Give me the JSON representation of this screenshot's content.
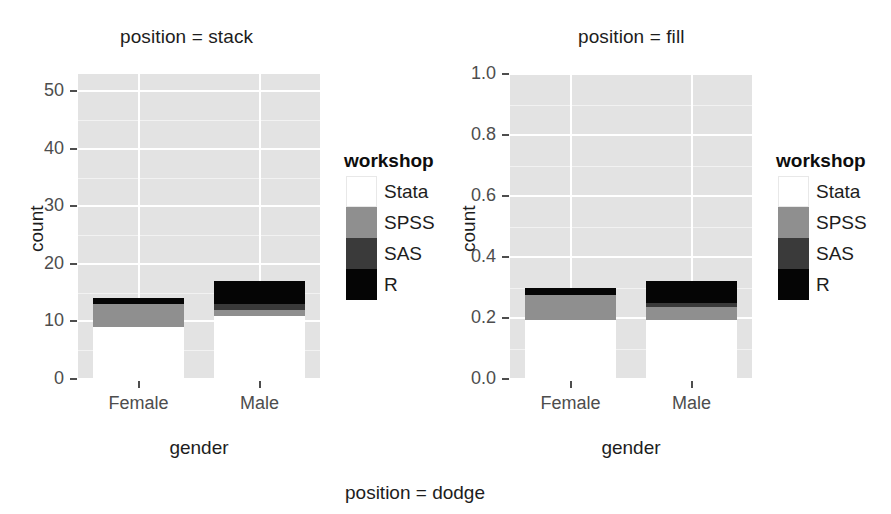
{
  "figure": {
    "bottom_caption": "position = dodge"
  },
  "panels": [
    {
      "id": "left",
      "title": "position = stack",
      "xlabel": "gender",
      "ylabel": "count",
      "ytick_labels": [
        "0",
        "10",
        "20",
        "30",
        "40",
        "50"
      ],
      "xtick_labels": [
        "Female",
        "Male"
      ]
    },
    {
      "id": "right",
      "title": "position = fill",
      "xlabel": "gender",
      "ylabel": "count",
      "ytick_labels": [
        "0.0",
        "0.2",
        "0.4",
        "0.6",
        "0.8",
        "1.0"
      ],
      "xtick_labels": [
        "Female",
        "Male"
      ]
    }
  ],
  "legend": {
    "title": "workshop",
    "items": [
      {
        "label": "Stata",
        "color": "#ffffff"
      },
      {
        "label": "SPSS",
        "color": "#8f8f8f"
      },
      {
        "label": "SAS",
        "color": "#3a3a3a"
      },
      {
        "label": "R",
        "color": "#050505"
      }
    ]
  },
  "colors": {
    "panel_background": "#e3e3e3",
    "gridline": "#ffffff",
    "stata": "#ffffff",
    "spss": "#8f8f8f",
    "sas": "#3a3a3a",
    "r": "#050505",
    "axis_text": "#4d4d4d",
    "title_text": "#1d1d1d"
  },
  "chart_data": [
    {
      "type": "bar",
      "subtype": "stacked",
      "title": "position = stack",
      "xlabel": "gender",
      "ylabel": "count",
      "ylim": [
        0,
        53
      ],
      "ytick_values": [
        0,
        10,
        20,
        30,
        40,
        50
      ],
      "grid": true,
      "legend_position": "right",
      "legend_title": "workshop",
      "categories": [
        "Female",
        "Male"
      ],
      "series": [
        {
          "name": "R",
          "color": "#050505",
          "values": [
            14,
            17
          ]
        },
        {
          "name": "SAS",
          "color": "#3a3a3a",
          "values": [
            11,
            13
          ]
        },
        {
          "name": "SPSS",
          "color": "#8f8f8f",
          "values": [
            13,
            12
          ]
        },
        {
          "name": "Stata",
          "color": "#ffffff",
          "values": [
            9,
            11
          ]
        }
      ],
      "stack_tops": {
        "Female": {
          "R": 14,
          "SAS": 25,
          "SPSS": 38,
          "Stata": 47
        },
        "Male": {
          "R": 17,
          "SAS": 30,
          "SPSS": 42,
          "Stata": 53
        }
      }
    },
    {
      "type": "bar",
      "subtype": "filled",
      "title": "position = fill",
      "xlabel": "gender",
      "ylabel": "count",
      "ylim": [
        0,
        1
      ],
      "ytick_values": [
        0.0,
        0.2,
        0.4,
        0.6,
        0.8,
        1.0
      ],
      "grid": true,
      "legend_position": "right",
      "legend_title": "workshop",
      "categories": [
        "Female",
        "Male"
      ],
      "series": [
        {
          "name": "R",
          "color": "#050505",
          "values": [
            0.3,
            0.32
          ]
        },
        {
          "name": "SAS",
          "color": "#3a3a3a",
          "values": [
            0.23,
            0.25
          ]
        },
        {
          "name": "SPSS",
          "color": "#8f8f8f",
          "values": [
            0.275,
            0.235
          ]
        },
        {
          "name": "Stata",
          "color": "#ffffff",
          "values": [
            0.195,
            0.195
          ]
        }
      ],
      "stack_tops": {
        "Female": {
          "R": 0.3,
          "SAS": 0.53,
          "SPSS": 0.805,
          "Stata": 1.0
        },
        "Male": {
          "R": 0.32,
          "SAS": 0.57,
          "SPSS": 0.805,
          "Stata": 1.0
        }
      }
    }
  ]
}
